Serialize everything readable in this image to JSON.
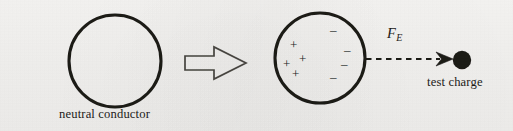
{
  "figure": {
    "background_color": "#f3f2f0",
    "ink_color": "#1d1b19",
    "width": 513,
    "height": 131
  },
  "labels": {
    "neutral_conductor": "neutral conductor",
    "test_charge": "test charge",
    "force_symbol": "F",
    "force_subscript": "E"
  },
  "icons": {
    "left_conductor": "circle-outline-icon",
    "transition_arrow": "block-arrow-right-icon",
    "right_conductor": "polarized-circle-icon",
    "force_vector": "dashed-arrow-right-icon",
    "test_charge_dot": "filled-circle-icon"
  },
  "diagram_data": {
    "type": "physics-schematic",
    "left_conductor": {
      "shape": "circle",
      "cx": 115,
      "cy": 61,
      "r": 46,
      "stroke_width": 3.1,
      "fill": "none",
      "label": "neutral conductor",
      "net_charge": 0
    },
    "block_arrow": {
      "direction": "right",
      "x_start": 185,
      "x_end": 246,
      "y_center": 63,
      "shaft_half_height": 7,
      "head_half_height": 16,
      "head_start_x": 214,
      "stroke_width": 1.6,
      "fill": "none"
    },
    "right_conductor": {
      "shape": "circle",
      "cx": 320,
      "cy": 58,
      "r": 45,
      "stroke_width": 3.1,
      "fill": "none",
      "net_charge": 0,
      "polarized": true,
      "positive_charges": [
        {
          "x": 294,
          "y": 45
        },
        {
          "x": 303,
          "y": 59
        },
        {
          "x": 287,
          "y": 64
        },
        {
          "x": 296,
          "y": 74
        }
      ],
      "negative_charges": [
        {
          "x": 333,
          "y": 30
        },
        {
          "x": 347,
          "y": 50
        },
        {
          "x": 344,
          "y": 64
        },
        {
          "x": 333,
          "y": 77
        }
      ]
    },
    "force_vector": {
      "style": "dashed",
      "x_start": 366,
      "x_end": 452,
      "y": 59,
      "stroke_width": 2.1,
      "dash_pattern": "5.5 4.5",
      "label": "F_E",
      "label_x": 387,
      "label_y": 26,
      "arrowhead": {
        "style": "barbed",
        "tip_x": 453,
        "length": 15,
        "half_height": 7
      }
    },
    "test_charge": {
      "shape": "filled-circle",
      "cx": 462,
      "cy": 60,
      "r": 9.2,
      "fill": "#1d1b19",
      "label": "test charge"
    }
  }
}
